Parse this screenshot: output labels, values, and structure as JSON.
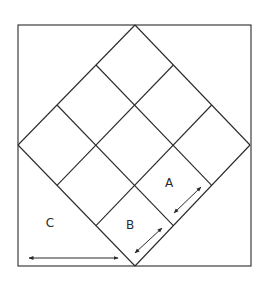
{
  "diagram": {
    "colors": {
      "line": "#2a2a2a",
      "background": "#ffffff"
    },
    "outer_square": {
      "x1": 18,
      "y1": 25,
      "x2": 251,
      "y2": 266
    },
    "diamond": {
      "top": [
        135,
        25
      ],
      "right": [
        250,
        145
      ],
      "bottom": [
        135,
        266
      ],
      "left": [
        18,
        145
      ],
      "grid_divisions": 3
    },
    "labels": [
      {
        "id": "A",
        "text": "A",
        "x": 169,
        "y": 183
      },
      {
        "id": "B",
        "text": "B",
        "x": 130,
        "y": 225
      },
      {
        "id": "C",
        "text": "C",
        "x": 50,
        "y": 223
      }
    ],
    "arrows": [
      {
        "id": "arrow-c",
        "label": "C",
        "x1": 29,
        "y1": 258,
        "x2": 118,
        "y2": 258
      },
      {
        "id": "arrow-b",
        "label": "B",
        "x1": 135,
        "y1": 253,
        "x2": 162,
        "y2": 228
      },
      {
        "id": "arrow-a",
        "label": "A",
        "x1": 174,
        "y1": 213,
        "x2": 201,
        "y2": 187
      }
    ]
  }
}
